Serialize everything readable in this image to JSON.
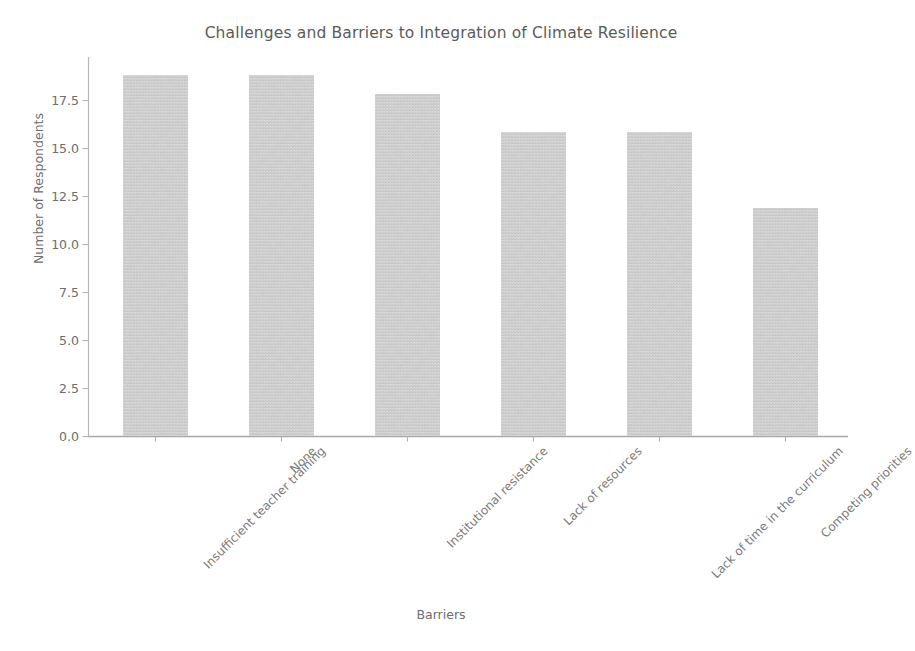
{
  "chart_data": {
    "type": "bar",
    "title": "Challenges and Barriers to Integration of Climate Resilience",
    "xlabel": "Barriers",
    "ylabel": "Number of Respondents",
    "categories": [
      "Insufficient teacher training",
      "None",
      "Institutional resistance",
      "Lack of resources",
      "Lack of time in the curriculum",
      "Competing priorities"
    ],
    "values": [
      19,
      19,
      18,
      16,
      16,
      12
    ],
    "ylim": [
      0.0,
      19.95
    ],
    "yticks": [
      0.0,
      2.5,
      5.0,
      7.5,
      10.0,
      12.5,
      15.0,
      17.5
    ],
    "ytick_labels": [
      "0.0",
      "2.5",
      "5.0",
      "7.5",
      "10.0",
      "12.5",
      "15.0",
      "17.5"
    ],
    "grid": false,
    "legend": null,
    "bar_color": "#c9c9c9",
    "axis_color": "#b5b5b5",
    "text_color": "#6d6d6d",
    "title_color": "#5b5b5b",
    "background": "#ffffff"
  }
}
